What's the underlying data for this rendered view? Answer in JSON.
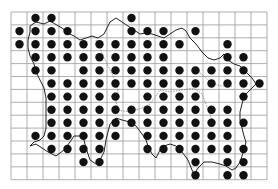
{
  "map": {
    "type": "grid distribution map",
    "grid": {
      "left": 11,
      "top": 12,
      "cell_w": 16,
      "cell_h": 12.9,
      "cols": 16,
      "rows": 13,
      "line_color": "#9a9a9a"
    },
    "dot_color": "#111111",
    "dot_radius": 4.2,
    "outline_color": "#222222",
    "dot_origin": {
      "x": 19.5,
      "y": 18,
      "dx": 16,
      "dy": 13.1
    },
    "rows": [
      [
        1,
        2,
        7
      ],
      [
        0,
        1,
        2,
        3,
        7,
        8,
        9,
        11
      ],
      [
        0,
        1,
        2,
        3,
        4,
        5,
        6,
        7,
        8,
        9,
        10,
        13
      ],
      [
        1,
        2,
        3,
        4,
        5,
        6,
        7,
        8,
        9,
        13,
        14
      ],
      [
        1,
        2,
        4,
        5,
        6,
        7,
        8,
        9,
        10,
        11,
        12,
        13,
        14
      ],
      [
        2,
        3,
        4,
        5,
        6,
        7,
        8,
        9,
        10,
        11,
        12,
        13,
        14,
        15
      ],
      [
        2,
        3,
        4,
        5,
        6,
        8,
        9,
        10,
        11,
        14
      ],
      [
        2,
        3,
        4,
        5,
        6,
        7,
        8,
        9,
        10,
        11,
        12,
        13
      ],
      [
        2,
        3,
        4,
        5,
        6,
        7,
        8,
        9,
        10,
        11,
        12,
        13,
        14
      ],
      [
        1,
        2,
        3,
        4,
        5,
        6,
        8,
        9,
        10,
        11,
        12,
        13
      ],
      [
        2,
        3,
        4,
        5,
        8,
        9,
        10,
        11,
        12,
        13,
        14
      ],
      [
        4,
        5,
        11,
        13,
        14
      ],
      [
        11,
        13,
        14
      ]
    ]
  }
}
